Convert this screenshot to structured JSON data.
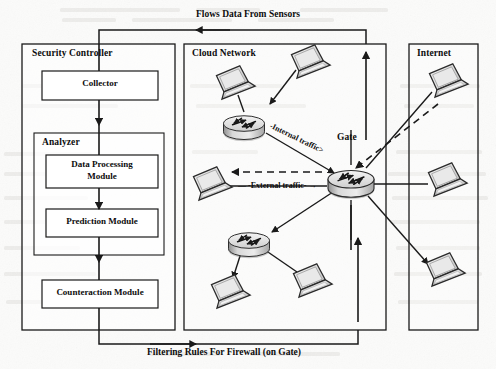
{
  "diagram": {
    "type": "network-architecture",
    "title_top": "Flows Data From Sensors",
    "title_bottom": "Filtering Rules For Firewall (on Gate)",
    "groups": [
      {
        "id": "security-controller",
        "label": "Security Controller"
      },
      {
        "id": "cloud-network",
        "label": "Cloud Network"
      },
      {
        "id": "internet",
        "label": "Internet"
      }
    ],
    "security_controller": {
      "label": "Security Controller",
      "collector": "Collector",
      "analyzer": {
        "label": "Analyzer",
        "modules": [
          "Data Processing\nModule",
          "Prediction Module"
        ],
        "module_1_line_1": "Data Processing",
        "module_1_line_2": "Module",
        "module_2": "Prediction Module"
      },
      "counteraction": "Counteraction Module"
    },
    "cloud_network": {
      "label": "Cloud Network",
      "gate_label": "Gate",
      "internal_traffic": "-Internal traffic>",
      "external_traffic": "-External traffic-",
      "routers": [
        {
          "id": "router-top",
          "name": "cloud-router-top"
        },
        {
          "id": "router-bottom",
          "name": "cloud-router-bottom"
        },
        {
          "id": "router-gate",
          "name": "gate-router"
        }
      ],
      "hosts": [
        {
          "id": "host-cloud-1",
          "name": "laptop-top-left"
        },
        {
          "id": "host-cloud-2",
          "name": "laptop-top-right"
        },
        {
          "id": "host-cloud-3",
          "name": "laptop-mid-left"
        },
        {
          "id": "host-cloud-4",
          "name": "laptop-bottom-left"
        },
        {
          "id": "host-cloud-5",
          "name": "laptop-bottom-right"
        }
      ]
    },
    "internet": {
      "label": "Internet",
      "hosts": [
        {
          "id": "host-net-1",
          "name": "laptop-internet-top"
        },
        {
          "id": "host-net-2",
          "name": "laptop-internet-mid"
        },
        {
          "id": "host-net-3",
          "name": "laptop-internet-bottom"
        }
      ]
    },
    "colors": {
      "line": "#1a1a1a",
      "box_fill": "#ffffff",
      "device_body": "#dcdcdc",
      "device_shade": "#9a9a9a",
      "page_bg": "#fbfbfa"
    }
  }
}
